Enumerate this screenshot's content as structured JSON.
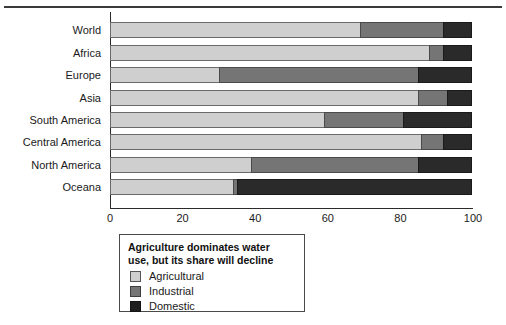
{
  "chart_data": {
    "type": "bar",
    "orientation": "horizontal",
    "stacked": true,
    "title": "",
    "xlabel": "",
    "ylabel": "",
    "xlim": [
      0,
      100
    ],
    "xticks": [
      0,
      20,
      40,
      60,
      80,
      100
    ],
    "grid": false,
    "legend_position": "below-left",
    "legend_title": "Agriculture dominates water use, but its share will decline",
    "categories": [
      "World",
      "Africa",
      "Europe",
      "Asia",
      "South America",
      "Central America",
      "North America",
      "Oceana"
    ],
    "series": [
      {
        "name": "Agricultural",
        "color": "#cfcfcf",
        "values": [
          69,
          88,
          30,
          85,
          59,
          86,
          39,
          34
        ]
      },
      {
        "name": "Industrial",
        "color": "#757575",
        "values": [
          23,
          4,
          55,
          8,
          22,
          6,
          46,
          1
        ]
      },
      {
        "name": "Domestic",
        "color": "#2a2a2a",
        "values": [
          8,
          8,
          15,
          7,
          19,
          8,
          15,
          65
        ]
      }
    ]
  },
  "axis": {
    "x_tick_labels": [
      "0",
      "20",
      "40",
      "60",
      "80",
      "100"
    ]
  },
  "legend": {
    "title_line1": "Agriculture dominates water",
    "title_line2": "use, but its share will decline",
    "items": [
      {
        "label": "Agricultural",
        "swatch_class": "agri"
      },
      {
        "label": "Industrial",
        "swatch_class": "indu"
      },
      {
        "label": "Domestic",
        "swatch_class": "dome"
      }
    ]
  }
}
